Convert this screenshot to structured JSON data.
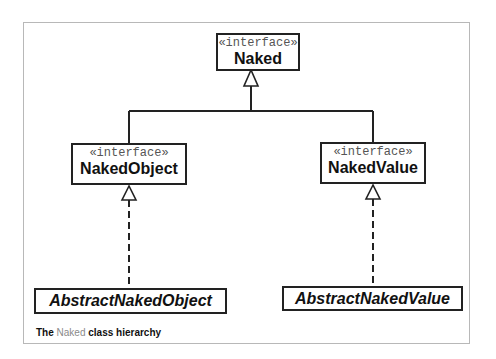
{
  "diagram": {
    "type": "uml-class-hierarchy",
    "nodes": {
      "naked": {
        "stereotype": "«interface»",
        "name": "Naked",
        "abstract": false
      },
      "naked_object": {
        "stereotype": "«interface»",
        "name": "NakedObject",
        "abstract": false
      },
      "naked_value": {
        "stereotype": "«interface»",
        "name": "NakedValue",
        "abstract": false
      },
      "abstract_naked_object": {
        "name": "AbstractNakedObject",
        "abstract": true
      },
      "abstract_naked_value": {
        "name": "AbstractNakedValue",
        "abstract": true
      }
    },
    "edges": [
      {
        "from": "NakedObject",
        "to": "Naked",
        "kind": "generalization",
        "style": "solid"
      },
      {
        "from": "NakedValue",
        "to": "Naked",
        "kind": "generalization",
        "style": "solid"
      },
      {
        "from": "AbstractNakedObject",
        "to": "NakedObject",
        "kind": "realization",
        "style": "dashed"
      },
      {
        "from": "AbstractNakedValue",
        "to": "NakedValue",
        "kind": "realization",
        "style": "dashed"
      }
    ]
  },
  "caption": {
    "prefix": "The",
    "highlight": "Naked",
    "suffix": "class hierarchy"
  }
}
